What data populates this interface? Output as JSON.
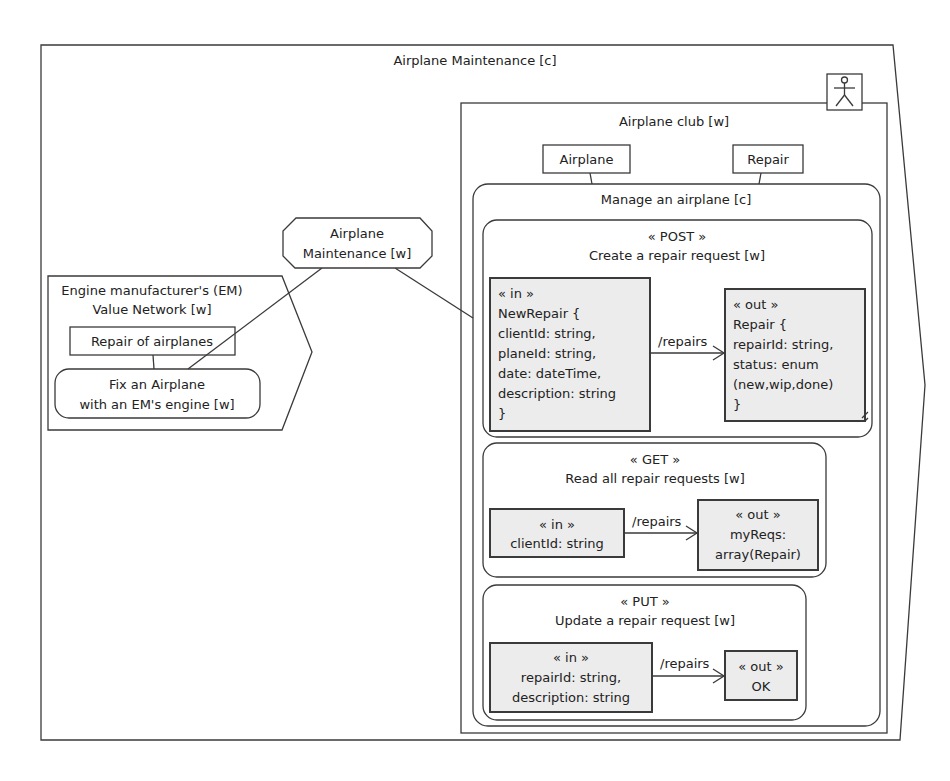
{
  "diagram": {
    "outer": {
      "title": "Airplane Maintenance [c]"
    },
    "actor": {
      "icon": "actor-stick-figure-icon"
    },
    "club": {
      "title": "Airplane club [w]",
      "entities": [
        {
          "label": "Airplane"
        },
        {
          "label": "Repair"
        }
      ],
      "manage": {
        "title": "Manage an airplane [c]",
        "operations": [
          {
            "stereotype": "« POST »",
            "title": "Create a repair request [w]",
            "path": "/repairs",
            "input": [
              "« in »",
              "NewRepair {",
              "clientId: string,",
              "planeId: string,",
              "date: dateTime,",
              "description: string",
              "}"
            ],
            "output": [
              "« out »",
              "Repair {",
              "repairId: string,",
              "status: enum",
              "(new,wip,done)",
              "}"
            ]
          },
          {
            "stereotype": "« GET »",
            "title": "Read all repair requests [w]",
            "path": "/repairs",
            "input": [
              "« in »",
              "clientId: string"
            ],
            "output": [
              "« out »",
              "myReqs:",
              "array(Repair)"
            ]
          },
          {
            "stereotype": "« PUT »",
            "title": "Update a repair request [w]",
            "path": "/repairs",
            "input": [
              "« in »",
              "repairId: string,",
              "description: string"
            ],
            "output": [
              "« out »",
              "OK"
            ]
          }
        ]
      }
    },
    "maintenance_node": {
      "lines": [
        "Airplane",
        "Maintenance [w]"
      ]
    },
    "em_network": {
      "title": [
        "Engine manufacturer's (EM)",
        "Value Network [w]"
      ],
      "entity": "Repair of airplanes",
      "activity": [
        "Fix an Airplane",
        "with an EM's engine [w]"
      ]
    }
  }
}
